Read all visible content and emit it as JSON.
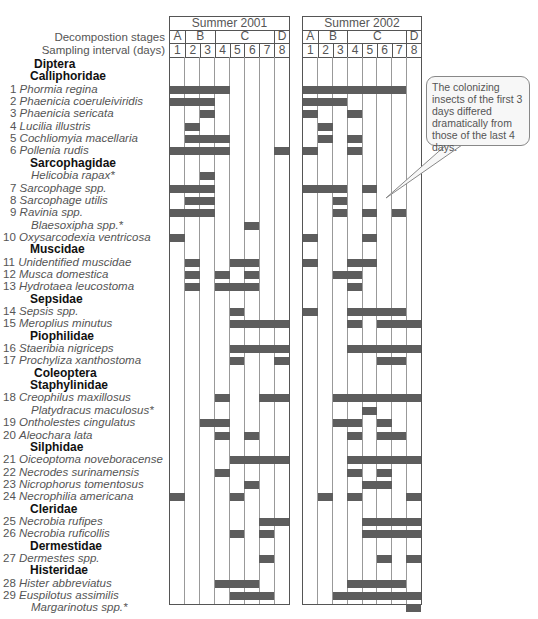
{
  "chart_data": {
    "type": "table",
    "title": "",
    "row_header_labels": {
      "stages": "Decompostion stages",
      "interval": "Sampling interval (days)"
    },
    "panels": [
      {
        "title": "Summer 2001",
        "stages": [
          {
            "label": "A",
            "span": [
              1,
              1
            ]
          },
          {
            "label": "B",
            "span": [
              2,
              3
            ]
          },
          {
            "label": "C",
            "span": [
              4,
              7
            ]
          },
          {
            "label": "D",
            "span": [
              8,
              8
            ]
          }
        ],
        "days": [
          "1",
          "2",
          "3",
          "4",
          "5",
          "6",
          "7",
          "8"
        ]
      },
      {
        "title": "Summer 2002",
        "stages": [
          {
            "label": "A",
            "span": [
              1,
              1
            ]
          },
          {
            "label": "B",
            "span": [
              2,
              3
            ]
          },
          {
            "label": "C",
            "span": [
              4,
              7
            ]
          },
          {
            "label": "D",
            "span": [
              8,
              8
            ]
          }
        ],
        "days": [
          "1",
          "2",
          "3",
          "4",
          "5",
          "6",
          "7",
          "8"
        ]
      }
    ],
    "rows": [
      {
        "kind": "order",
        "label": "Diptera"
      },
      {
        "kind": "family",
        "label": "Calliphoridae"
      },
      {
        "kind": "species",
        "num": "1",
        "label": "Phormia regina",
        "y2001": [
          1,
          2,
          3,
          4
        ],
        "y2002": [
          1,
          2,
          3,
          4,
          5,
          6,
          7
        ]
      },
      {
        "kind": "species",
        "num": "2",
        "label": "Phaenicia coeruleiviridis",
        "y2001": [
          1,
          2,
          3
        ],
        "y2002": [
          1,
          2,
          3
        ]
      },
      {
        "kind": "species",
        "num": "3",
        "label": "Phaenicia sericata",
        "y2001": [
          3
        ],
        "y2002": [
          1,
          4
        ]
      },
      {
        "kind": "species",
        "num": "4",
        "label": "Lucilia illustris",
        "y2001": [
          2
        ],
        "y2002": [
          2
        ]
      },
      {
        "kind": "species",
        "num": "5",
        "label": "Cochliomyia macellaria",
        "y2001": [
          2,
          3,
          4
        ],
        "y2002": [
          2,
          4
        ]
      },
      {
        "kind": "species",
        "num": "6",
        "label": "Pollenia rudis",
        "y2001": [
          1,
          2,
          3,
          4,
          8
        ],
        "y2002": [
          1,
          4
        ]
      },
      {
        "kind": "family",
        "label": "Sarcophagidae"
      },
      {
        "kind": "species",
        "num": "",
        "label": "Helicobia rapax*",
        "y2001": [
          3
        ],
        "y2002": []
      },
      {
        "kind": "species",
        "num": "7",
        "label": "Sarcophage spp.",
        "y2001": [
          1,
          2,
          3
        ],
        "y2002": [
          1,
          2,
          3,
          5
        ]
      },
      {
        "kind": "species",
        "num": "8",
        "label": "Sarcophage utilis",
        "y2001": [
          2,
          3
        ],
        "y2002": [
          3
        ]
      },
      {
        "kind": "species",
        "num": "9",
        "label": "Ravinia spp.",
        "y2001": [
          1,
          2,
          3
        ],
        "y2002": [
          3,
          5,
          7
        ]
      },
      {
        "kind": "species",
        "num": "",
        "label": "Blaesoxipha spp.*",
        "y2001": [
          6
        ],
        "y2002": []
      },
      {
        "kind": "species",
        "num": "10",
        "label": "Oxysarcodexia ventricosa",
        "y2001": [
          1
        ],
        "y2002": [
          1,
          5
        ]
      },
      {
        "kind": "family",
        "label": "Muscidae"
      },
      {
        "kind": "species",
        "num": "11",
        "label": "Unidentified muscidae",
        "y2001": [
          2,
          5,
          6
        ],
        "y2002": [
          1,
          4,
          5
        ]
      },
      {
        "kind": "species",
        "num": "12",
        "label": "Musca domestica",
        "y2001": [
          2,
          4,
          6
        ],
        "y2002": [
          3,
          4
        ]
      },
      {
        "kind": "species",
        "num": "13",
        "label": "Hydrotaea leucostoma",
        "y2001": [
          2,
          4,
          5,
          6
        ],
        "y2002": [
          4
        ]
      },
      {
        "kind": "family",
        "label": "Sepsidae"
      },
      {
        "kind": "species",
        "num": "14",
        "label": "Sepsis spp.",
        "y2001": [
          5
        ],
        "y2002": [
          1,
          4,
          5,
          6,
          7
        ]
      },
      {
        "kind": "species",
        "num": "15",
        "label": "Meroplius minutus",
        "y2001": [
          5,
          6,
          7,
          8
        ],
        "y2002": [
          4,
          6,
          7,
          8
        ]
      },
      {
        "kind": "family",
        "label": "Piophilidae"
      },
      {
        "kind": "species",
        "num": "16",
        "label": "Staeribia nigriceps",
        "y2001": [
          5,
          6,
          7,
          8
        ],
        "y2002": [
          4,
          5,
          6,
          7,
          8
        ]
      },
      {
        "kind": "species",
        "num": "17",
        "label": "Prochyliza xanthostoma",
        "y2001": [
          5,
          8
        ],
        "y2002": [
          6,
          7
        ]
      },
      {
        "kind": "order",
        "label": "Coleoptera"
      },
      {
        "kind": "family",
        "label": "Staphylinidae"
      },
      {
        "kind": "species",
        "num": "18",
        "label": "Creophilus maxillosus",
        "y2001": [
          4,
          7,
          8
        ],
        "y2002": [
          3,
          4,
          5,
          6,
          7,
          8
        ]
      },
      {
        "kind": "species",
        "num": "",
        "label": "Platydracus maculosus*",
        "y2001": [],
        "y2002": [
          5
        ]
      },
      {
        "kind": "species",
        "num": "19",
        "label": "Ontholestes cingulatus",
        "y2001": [
          3,
          4
        ],
        "y2002": [
          3,
          4,
          6
        ]
      },
      {
        "kind": "species",
        "num": "20",
        "label": "Aleochara lata",
        "y2001": [
          4,
          6
        ],
        "y2002": [
          4,
          6,
          7
        ]
      },
      {
        "kind": "family",
        "label": "Silphidae"
      },
      {
        "kind": "species",
        "num": "21",
        "label": "Oiceoptoma noveboracense",
        "y2001": [
          5,
          6,
          7,
          8
        ],
        "y2002": [
          4,
          5,
          6,
          7,
          8
        ]
      },
      {
        "kind": "species",
        "num": "22",
        "label": "Necrodes surinamensis",
        "y2001": [
          4
        ],
        "y2002": [
          4,
          6
        ]
      },
      {
        "kind": "species",
        "num": "23",
        "label": "Nicrophorus tomentosus",
        "y2001": [
          6
        ],
        "y2002": [
          5,
          6
        ]
      },
      {
        "kind": "species",
        "num": "24",
        "label": "Necrophilia americana",
        "y2001": [
          1,
          5
        ],
        "y2002": [
          2,
          4,
          8
        ]
      },
      {
        "kind": "family",
        "label": "Cleridae"
      },
      {
        "kind": "species",
        "num": "25",
        "label": "Necrobia rufipes",
        "y2001": [
          7,
          8
        ],
        "y2002": [
          5,
          6,
          7,
          8
        ]
      },
      {
        "kind": "species",
        "num": "26",
        "label": "Necrobia ruficollis",
        "y2001": [
          5,
          7
        ],
        "y2002": [
          5,
          6,
          7,
          8
        ]
      },
      {
        "kind": "family",
        "label": "Dermestidae"
      },
      {
        "kind": "species",
        "num": "27",
        "label": "Dermestes spp.",
        "y2001": [
          7
        ],
        "y2002": [
          6,
          8
        ]
      },
      {
        "kind": "family",
        "label": "Histeridae"
      },
      {
        "kind": "species",
        "num": "28",
        "label": "Hister abbreviatus",
        "y2001": [
          4,
          5,
          6
        ],
        "y2002": [
          4,
          5,
          6,
          7
        ]
      },
      {
        "kind": "species",
        "num": "29",
        "label": "Euspilotus assimilis",
        "y2001": [
          5,
          6,
          7
        ],
        "y2002": [
          3,
          4,
          5,
          6,
          7,
          8
        ]
      },
      {
        "kind": "species",
        "num": "",
        "label": "Margarinotus spp.*",
        "y2001": [],
        "y2002": [
          8
        ]
      }
    ],
    "annotation": "The colonizing insects of the first 3 days differed dramatically from those of the last 4 days.",
    "bar_color": "#5d5d5d",
    "grid": true
  }
}
